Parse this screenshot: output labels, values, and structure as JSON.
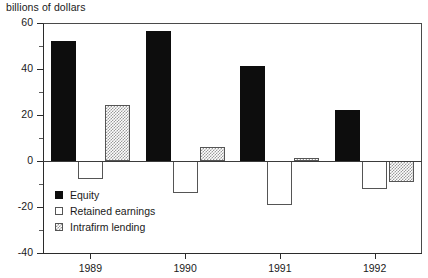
{
  "chart_data": {
    "type": "bar",
    "title": "billions of dollars",
    "xlabel": "",
    "ylabel": "billions of dollars",
    "categories": [
      "1989",
      "1990",
      "1991",
      "1992"
    ],
    "series": [
      {
        "name": "Equity",
        "values": [
          52,
          56.5,
          41.5,
          22
        ],
        "color": "#0d0d0d",
        "fill": "solid-black"
      },
      {
        "name": "Retained earnings",
        "values": [
          -8,
          -14,
          -19,
          -12
        ],
        "color": "#ffffff",
        "fill": "white-outline"
      },
      {
        "name": "Intrafirm lending",
        "values": [
          24.5,
          6,
          1.5,
          -9
        ],
        "color": "#9a9a9a",
        "fill": "gray-hatched"
      }
    ],
    "ylim": [
      -40,
      60
    ],
    "ytick_labels": [
      "60",
      "40",
      "20",
      "0",
      "-20",
      "-40"
    ],
    "ytick_values": [
      60,
      40,
      20,
      0,
      -20,
      -40
    ],
    "yminor_values": [
      50,
      30,
      10,
      -10,
      -30
    ],
    "grid": false,
    "legend_position": "inside-lower-left",
    "legend": [
      "Equity",
      "Retained earnings",
      "Intrafirm lending"
    ]
  }
}
